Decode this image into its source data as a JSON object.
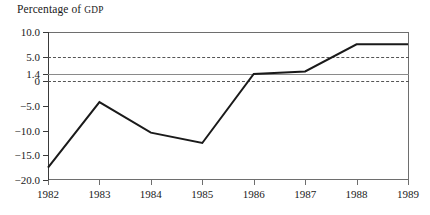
{
  "chart_data": {
    "type": "line",
    "title": "Percentage of GDP",
    "title_main": "Percentage of ",
    "title_smallcaps": "GDP",
    "xlabel": "",
    "ylabel": "",
    "x": [
      1982,
      1983,
      1984,
      1985,
      1986,
      1987,
      1988,
      1989
    ],
    "categories": [
      "1982",
      "1983",
      "1984",
      "1985",
      "1986",
      "1987",
      "1988",
      "1989"
    ],
    "values": [
      -17.5,
      -4.2,
      -10.4,
      -12.5,
      1.5,
      2.0,
      7.5,
      7.5
    ],
    "series": [
      {
        "name": "Percentage of GDP",
        "values": [
          -17.5,
          -4.2,
          -10.4,
          -12.5,
          1.5,
          2.0,
          7.5,
          7.5
        ],
        "color": "#1a1a1a",
        "width": 2
      }
    ],
    "ylim": [
      -20.0,
      10.0
    ],
    "xlim": [
      1982,
      1989
    ],
    "ytick_values": [
      10.0,
      5.0,
      1.4,
      0,
      -5.0,
      -10.0,
      -15.0,
      -20.0
    ],
    "ytick_labels": [
      "10.0",
      "5.0",
      "1.4",
      "0",
      "−5.0",
      "−10.0",
      "−15.0",
      "−20.0"
    ],
    "xtick_values": [
      1982,
      1983,
      1984,
      1985,
      1986,
      1987,
      1988,
      1989
    ],
    "xtick_labels": [
      "1982",
      "1983",
      "1984",
      "1985",
      "1986",
      "1987",
      "1988",
      "1989"
    ],
    "reference_lines": [
      {
        "value": 5.0,
        "style": "dashed",
        "color": "#555555",
        "label": "5.0"
      },
      {
        "value": 1.4,
        "style": "solid",
        "color": "#8a8a8a",
        "label": "1.4"
      },
      {
        "value": 0,
        "style": "dashed",
        "color": "#555555",
        "label": "0"
      }
    ],
    "grid": true,
    "legend": null,
    "legend_position": "none"
  }
}
